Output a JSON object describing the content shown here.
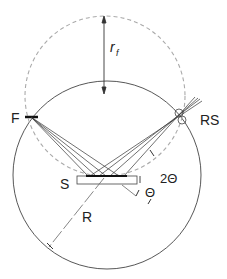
{
  "diagram": {
    "labels": {
      "focusing_radius": "r",
      "focusing_radius_sub": "f",
      "source": "F",
      "receiving_slit": "RS",
      "sample": "S",
      "goniometer_radius": "R",
      "two_theta": "2Θ",
      "theta": "Θ"
    },
    "colors": {
      "line": "#333333",
      "dashed": "#aaaaaa",
      "background": "#ffffff"
    }
  }
}
